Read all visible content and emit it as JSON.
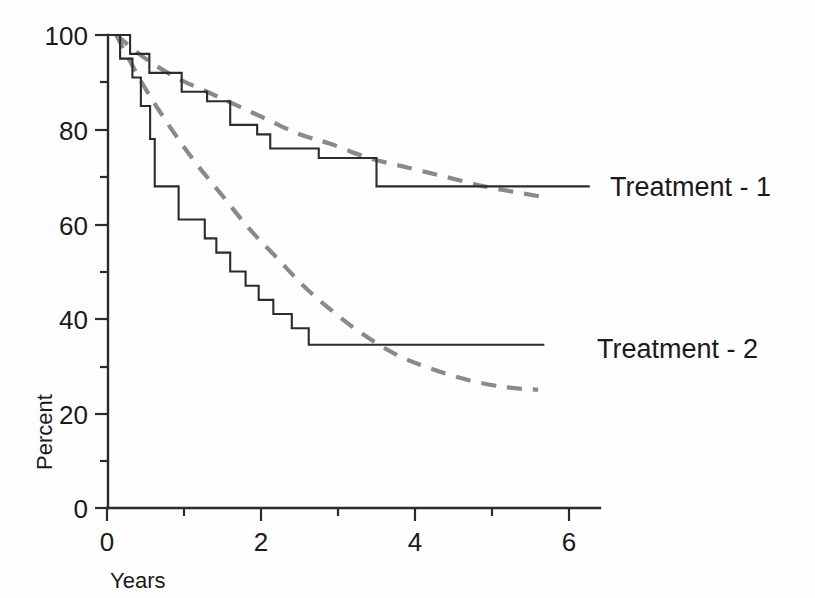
{
  "chart_data": {
    "type": "line",
    "title": "",
    "subtitle": "",
    "xlabel": "Years",
    "ylabel": "Percent",
    "xlim": [
      0,
      6.3
    ],
    "ylim": [
      0,
      100
    ],
    "grid": false,
    "legend_position": "right-inline-labels",
    "x_ticks_major": [
      0,
      2,
      4,
      6
    ],
    "x_tick_labels": [
      "0",
      "2",
      "4",
      "6"
    ],
    "x_ticks_minor": [
      1,
      3,
      5
    ],
    "y_ticks_major": [
      0,
      20,
      40,
      60,
      80,
      100
    ],
    "y_tick_labels": [
      "0",
      "20",
      "40",
      "60",
      "80",
      "100"
    ],
    "y_ticks_minor": [
      10,
      30,
      50,
      70,
      90
    ],
    "annotations": [
      {
        "name": "treatment-1-label",
        "text": "Treatment - 1",
        "x": 6.4,
        "y": 68
      },
      {
        "name": "treatment-2-label",
        "text": "Treatment - 2",
        "x": 6.1,
        "y": 34
      }
    ],
    "series": [
      {
        "name": "Treatment - 1",
        "style": "step",
        "line_style": "solid",
        "color": "#2b2b2b",
        "points": [
          [
            0.0,
            100
          ],
          [
            0.3,
            100
          ],
          [
            0.3,
            96
          ],
          [
            0.55,
            96
          ],
          [
            0.55,
            92
          ],
          [
            0.97,
            92
          ],
          [
            0.97,
            88
          ],
          [
            1.3,
            88
          ],
          [
            1.3,
            86
          ],
          [
            1.6,
            86
          ],
          [
            1.6,
            81
          ],
          [
            1.95,
            81
          ],
          [
            1.95,
            79
          ],
          [
            2.12,
            79
          ],
          [
            2.12,
            76
          ],
          [
            2.75,
            76
          ],
          [
            2.75,
            74
          ],
          [
            3.5,
            74
          ],
          [
            3.5,
            68
          ],
          [
            6.27,
            68
          ]
        ]
      },
      {
        "name": "Treatment - 1 fitted",
        "style": "smooth",
        "line_style": "dashed",
        "color": "#8a8a8a",
        "points": [
          [
            0.12,
            100
          ],
          [
            0.5,
            95
          ],
          [
            0.9,
            91
          ],
          [
            1.3,
            88
          ],
          [
            1.7,
            85
          ],
          [
            2.1,
            82
          ],
          [
            2.5,
            79
          ],
          [
            2.9,
            77
          ],
          [
            3.4,
            74
          ],
          [
            3.9,
            72
          ],
          [
            4.4,
            70
          ],
          [
            4.9,
            68
          ],
          [
            5.4,
            66.5
          ],
          [
            5.75,
            65.5
          ]
        ]
      },
      {
        "name": "Treatment - 2",
        "style": "step",
        "line_style": "solid",
        "color": "#2b2b2b",
        "points": [
          [
            0.0,
            100
          ],
          [
            0.17,
            100
          ],
          [
            0.17,
            95
          ],
          [
            0.33,
            95
          ],
          [
            0.33,
            91
          ],
          [
            0.44,
            91
          ],
          [
            0.44,
            85
          ],
          [
            0.56,
            85
          ],
          [
            0.56,
            78
          ],
          [
            0.62,
            78
          ],
          [
            0.62,
            68
          ],
          [
            0.93,
            68
          ],
          [
            0.93,
            61
          ],
          [
            1.27,
            61
          ],
          [
            1.27,
            57
          ],
          [
            1.42,
            57
          ],
          [
            1.42,
            54
          ],
          [
            1.6,
            54
          ],
          [
            1.6,
            50
          ],
          [
            1.8,
            50
          ],
          [
            1.8,
            47
          ],
          [
            1.97,
            47
          ],
          [
            1.97,
            44
          ],
          [
            2.16,
            44
          ],
          [
            2.16,
            41
          ],
          [
            2.4,
            41
          ],
          [
            2.4,
            38
          ],
          [
            2.62,
            38
          ],
          [
            2.62,
            34.5
          ],
          [
            5.68,
            34.5
          ]
        ]
      },
      {
        "name": "Treatment - 2 fitted",
        "style": "smooth",
        "line_style": "dashed",
        "color": "#8a8a8a",
        "points": [
          [
            0.12,
            100
          ],
          [
            0.45,
            90
          ],
          [
            0.8,
            81
          ],
          [
            1.15,
            73
          ],
          [
            1.5,
            66
          ],
          [
            1.85,
            59
          ],
          [
            2.2,
            53
          ],
          [
            2.55,
            47
          ],
          [
            2.9,
            42
          ],
          [
            3.3,
            37
          ],
          [
            3.75,
            32.5
          ],
          [
            4.2,
            29.5
          ],
          [
            4.7,
            27
          ],
          [
            5.2,
            25.5
          ],
          [
            5.6,
            25
          ]
        ]
      }
    ]
  },
  "axes_geometry": {
    "x_pixel_at_0": 107,
    "x_pixel_per_unit": 77.0,
    "y_pixel_at_0": 508,
    "y_pixel_per_unit": 4.73
  }
}
